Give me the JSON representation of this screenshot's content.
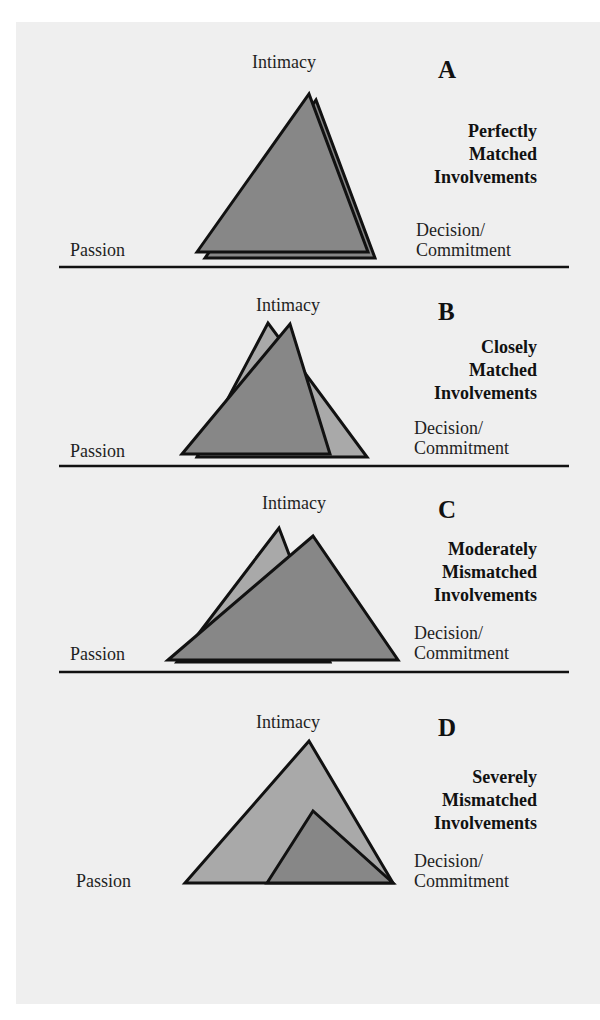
{
  "colors": {
    "background": "#efefef",
    "page": "#ffffff",
    "fill_dark": "#878787",
    "fill_light": "#a9a9a9",
    "stroke": "#111111"
  },
  "axis_labels": {
    "top": "Intimacy",
    "left": "Passion",
    "right_line1": "Decision/",
    "right_line2": "Commitment"
  },
  "panels": [
    {
      "letter": "A",
      "title_lines": [
        "Perfectly",
        "Matched",
        "Involvements"
      ],
      "triangles": [
        {
          "role": "partner-2",
          "shade": "dark",
          "points": "205,258 316,100 375,258"
        },
        {
          "role": "partner-1",
          "shade": "dark",
          "points": "197,252 309,94 368,252"
        }
      ]
    },
    {
      "letter": "B",
      "title_lines": [
        "Closely",
        "Matched",
        "Involvements"
      ],
      "triangles": [
        {
          "role": "partner-2",
          "shade": "light",
          "points": "197,457 268,323 367,457"
        },
        {
          "role": "partner-1",
          "shade": "dark",
          "points": "182,454 290,324 330,454"
        }
      ]
    },
    {
      "letter": "C",
      "title_lines": [
        "Moderately",
        "Mismatched",
        "Involvements"
      ],
      "triangles": [
        {
          "role": "partner-2",
          "shade": "light",
          "points": "177,662 279,528 330,662"
        },
        {
          "role": "partner-1",
          "shade": "dark",
          "points": "168,660 313,536 398,660"
        }
      ]
    },
    {
      "letter": "D",
      "title_lines": [
        "Severely",
        "Mismatched",
        "Involvements"
      ],
      "triangles": [
        {
          "role": "partner-1",
          "shade": "light",
          "points": "185,883 309,741 393,883"
        },
        {
          "role": "partner-2",
          "shade": "dark",
          "points": "267,883 313,811 393,883"
        }
      ]
    }
  ]
}
